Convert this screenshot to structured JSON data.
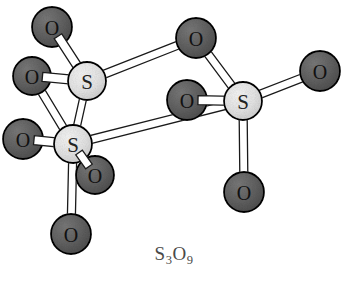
{
  "figure": {
    "formula_text": "S3O9",
    "formula_parts": [
      {
        "text": "S",
        "sub": false
      },
      {
        "text": "3",
        "sub": true
      },
      {
        "text": "O",
        "sub": false
      },
      {
        "text": "9",
        "sub": true
      }
    ],
    "background_color": "#ffffff"
  },
  "legend": {
    "sulfur_label": "S",
    "oxygen_label": "O",
    "sulfur_color": "#e2e2e2",
    "oxygen_color": "#5f5f5f",
    "outline_color": "#000000",
    "bond_fill_color": "#ffffff",
    "bond_outline_color": "#1a1a1a"
  },
  "chart_data": {
    "type": "diagram",
    "title": "S3O9",
    "atoms": [
      {
        "id": "O1",
        "element": "O",
        "label": "O",
        "x": 52,
        "y": 27,
        "r": 20
      },
      {
        "id": "O2",
        "element": "O",
        "label": "O",
        "x": 32,
        "y": 76,
        "r": 19
      },
      {
        "id": "S1",
        "element": "S",
        "label": "S",
        "x": 87,
        "y": 81,
        "r": 19
      },
      {
        "id": "O3",
        "element": "O",
        "label": "O",
        "x": 196,
        "y": 38,
        "r": 20
      },
      {
        "id": "O4",
        "element": "O",
        "label": "O",
        "x": 23,
        "y": 139,
        "r": 20
      },
      {
        "id": "S2",
        "element": "S",
        "label": "S",
        "x": 73,
        "y": 144,
        "r": 19
      },
      {
        "id": "O5",
        "element": "O",
        "label": "O",
        "x": 187,
        "y": 100,
        "r": 20
      },
      {
        "id": "S3",
        "element": "S",
        "label": "S",
        "x": 243,
        "y": 101,
        "r": 19
      },
      {
        "id": "O6",
        "element": "O",
        "label": "O",
        "x": 320,
        "y": 71,
        "r": 20
      },
      {
        "id": "O7",
        "element": "O",
        "label": "O",
        "x": 95,
        "y": 175,
        "r": 19
      },
      {
        "id": "O8",
        "element": "O",
        "label": "O",
        "x": 244,
        "y": 192,
        "r": 20
      },
      {
        "id": "O9",
        "element": "O",
        "label": "O",
        "x": 71,
        "y": 234,
        "r": 20
      }
    ],
    "bonds": [
      {
        "from": "O1",
        "to": "S1",
        "width": 9
      },
      {
        "from": "O2",
        "to": "S1",
        "width": 9
      },
      {
        "from": "O2",
        "to": "S2",
        "width": 8
      },
      {
        "from": "S1",
        "to": "S2",
        "width": 7
      },
      {
        "from": "S1",
        "to": "O3",
        "width": 8
      },
      {
        "from": "O3",
        "to": "S3",
        "width": 8
      },
      {
        "from": "S2",
        "to": "S3",
        "width": 8
      },
      {
        "from": "O4",
        "to": "S2",
        "width": 9
      },
      {
        "from": "S2",
        "to": "O7",
        "width": 8
      },
      {
        "from": "S2",
        "to": "O9",
        "width": 8
      },
      {
        "from": "O5",
        "to": "S3",
        "width": 9
      },
      {
        "from": "S3",
        "to": "O6",
        "width": 8
      },
      {
        "from": "S3",
        "to": "O8",
        "width": 8
      }
    ],
    "draw_order": [
      "bond:S1-O3",
      "bond:O3-S3",
      "bond:S2-S3",
      "bond:S1-S2",
      "bond:O2-S2",
      "bond:S2-O9",
      "bond:S3-O6",
      "bond:S3-O8",
      "atom:O1",
      "bond:O1-S1",
      "atom:O3",
      "atom:O6",
      "atom:O2",
      "bond:O2-S1",
      "atom:S1",
      "atom:O4",
      "bond:O4-S2",
      "atom:O5",
      "bond:O5-S3",
      "atom:S3",
      "atom:S2",
      "atom:O7",
      "bond:S2-O7",
      "atom:O8",
      "atom:O9"
    ]
  }
}
